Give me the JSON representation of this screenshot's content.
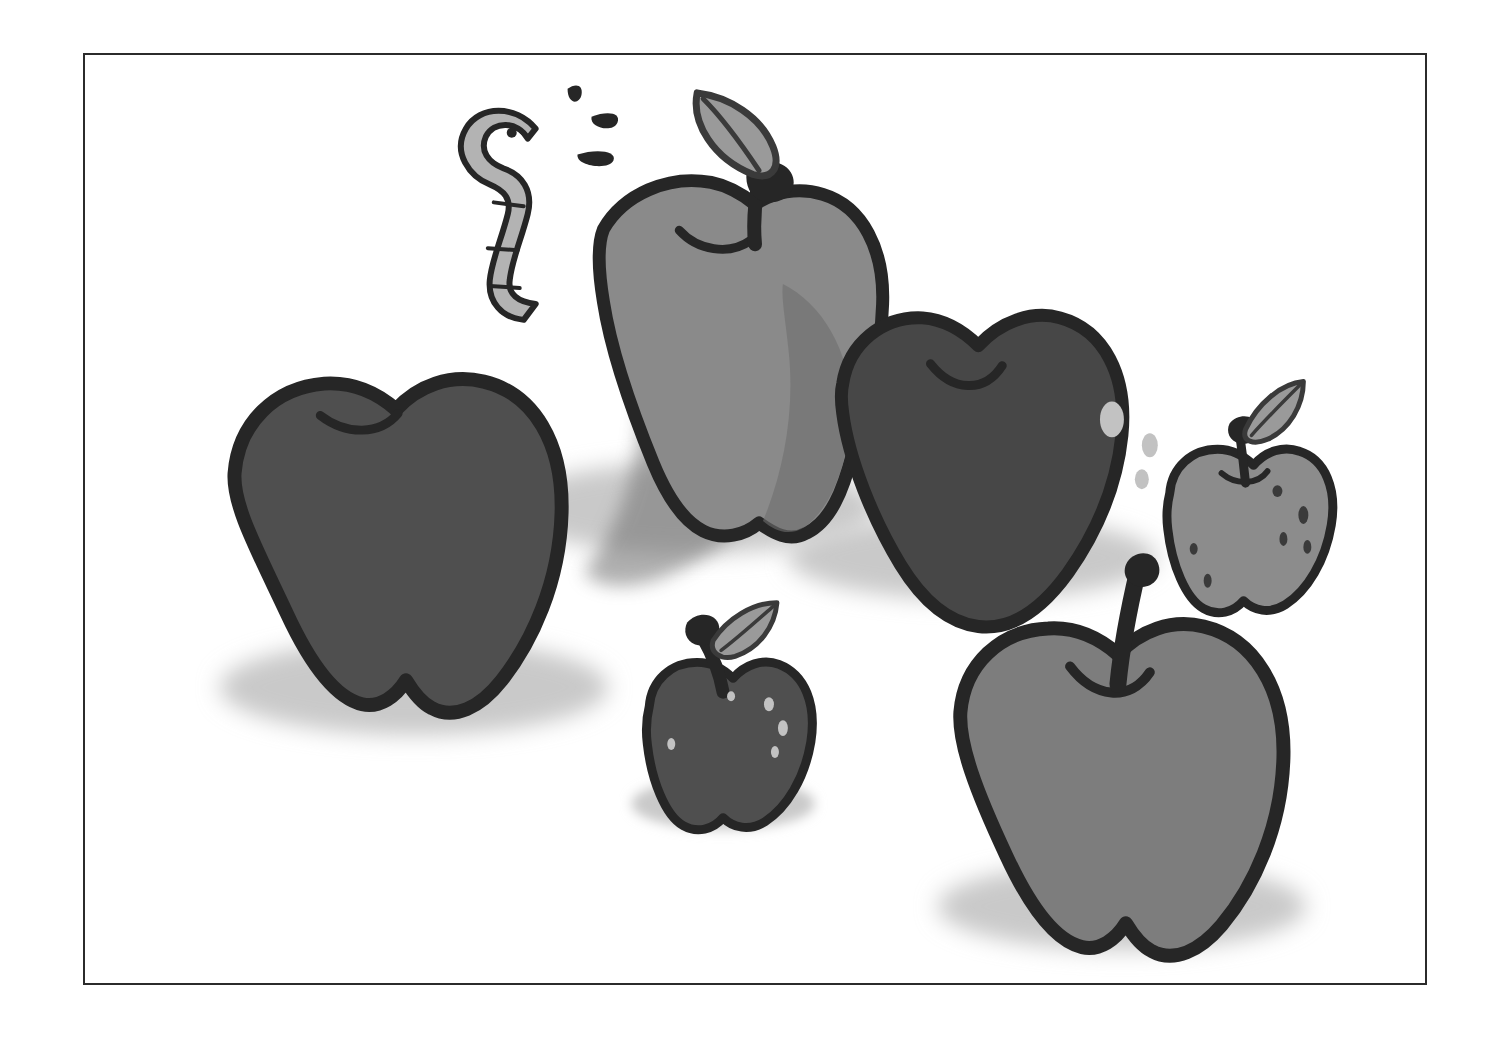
{
  "artwork": {
    "title": "Apples with Worm",
    "style": "grayscale cartoon line illustration",
    "background_color": "#ffffff",
    "frame": {
      "border_color": "#2b2b2b",
      "border_width_px": 2,
      "x": 83,
      "y": 53,
      "width": 1344,
      "height": 932
    },
    "palette": {
      "outline": "#262626",
      "apple_dark": "#4f4f4f",
      "apple_darker": "#474747",
      "apple_mid": "#7d7d7d",
      "apple_light": "#8a8a8a",
      "apple_small_light": "#8c8c8c",
      "shadow": "#c9c9c9",
      "shade_overlay": "#6b6b6b",
      "speckle_light": "#c2c2c2",
      "speckle_dark": "#3a3a3a",
      "worm_body": "#b3b3b3",
      "leaf_fill": "#9a9a9a",
      "stem": "#262626",
      "paper": "#ffffff"
    },
    "objects": [
      {
        "id": "apple-back-left-large",
        "name": "large dark apple front left",
        "fill": "#4f4f4f",
        "size": "large",
        "has_stem": false,
        "has_leaf": false,
        "has_worm": false,
        "speckles": 0,
        "shadow": true
      },
      {
        "id": "apple-back-center-large",
        "name": "large light apple center back with leaf and worm",
        "fill": "#8a8a8a",
        "size": "large",
        "has_stem": true,
        "has_leaf": true,
        "has_worm": true,
        "speckles": 0,
        "shadow": true
      },
      {
        "id": "apple-back-right-large",
        "name": "large dark apple right back with light speckles",
        "fill": "#474747",
        "size": "large",
        "has_stem": false,
        "has_leaf": false,
        "has_worm": false,
        "speckles": 3,
        "shadow": true
      },
      {
        "id": "apple-small-right",
        "name": "small light apple far right with leaf and dark speckles",
        "fill": "#8c8c8c",
        "size": "small",
        "has_stem": true,
        "has_leaf": true,
        "has_worm": false,
        "speckles": 6,
        "shadow": false
      },
      {
        "id": "apple-small-center",
        "name": "small dark apple front center with leaf and light speckles",
        "fill": "#4f4f4f",
        "size": "small",
        "has_stem": true,
        "has_leaf": true,
        "has_worm": false,
        "speckles": 5,
        "shadow": true
      },
      {
        "id": "apple-front-right-large",
        "name": "large mid-gray apple front right with tall curved stem",
        "fill": "#7d7d7d",
        "size": "large",
        "has_stem": true,
        "has_leaf": false,
        "has_worm": false,
        "speckles": 0,
        "shadow": true
      }
    ],
    "worm": {
      "name": "cartoon worm peeking over apple",
      "body_fill": "#b3b3b3",
      "outline": "#262626",
      "has_eye": true,
      "segments": 3,
      "surprise_marks": 3
    }
  }
}
